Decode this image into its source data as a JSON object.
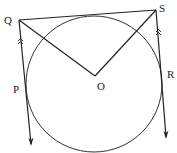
{
  "figure": {
    "labels": {
      "Q": "Q",
      "S": "S",
      "O": "O",
      "P": "P",
      "R": "R"
    },
    "stroke_color": "#222222",
    "background": "#ffffff",
    "parallel_marks": ">>"
  }
}
